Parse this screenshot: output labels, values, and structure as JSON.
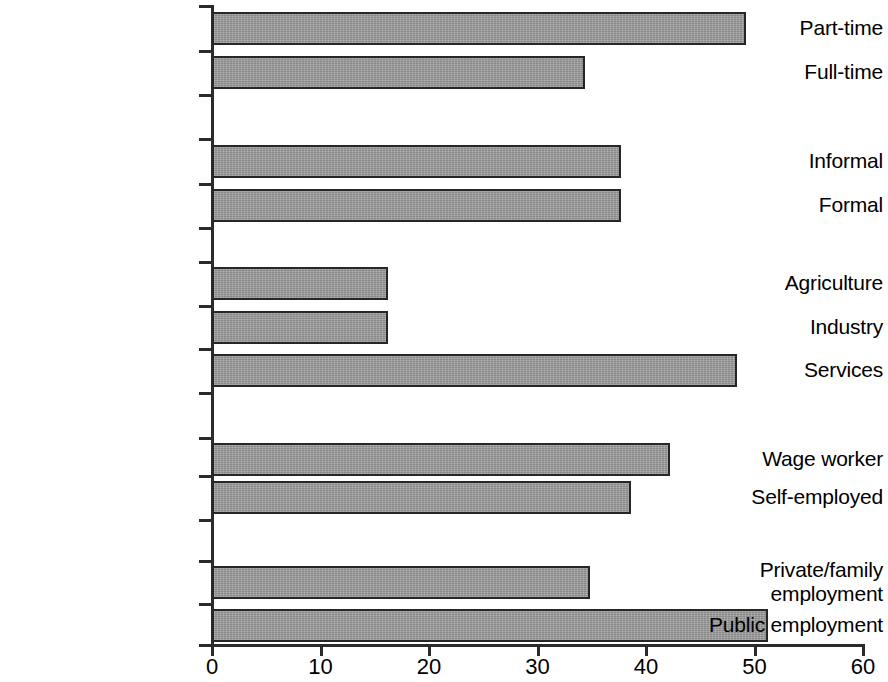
{
  "chart_data": {
    "type": "bar",
    "orientation": "horizontal",
    "title": "",
    "subtitle": "",
    "xlabel": "",
    "ylabel": "",
    "xlim": [
      0,
      60
    ],
    "xticks": [
      0,
      10,
      20,
      30,
      40,
      50,
      60
    ],
    "xtick_labels": [
      "0",
      "10",
      "20",
      "30",
      "40",
      "50",
      "60"
    ],
    "grid": false,
    "legend": null,
    "bar_color": "#9b9b9b",
    "bar_edge_color": "#262626",
    "axis_color": "#2b2b2b",
    "categories": [
      "Part-time",
      "Full-time",
      "Informal",
      "Formal",
      "Agriculture",
      "Industry",
      "Services",
      "Wage worker",
      "Self-employed",
      "Private/family\nemployment",
      "Public employment"
    ],
    "values": [
      49.2,
      34.4,
      37.7,
      37.7,
      16.2,
      16.2,
      48.4,
      42.2,
      38.6,
      34.8,
      51.2
    ],
    "groups": [
      {
        "name": "work-hours",
        "categories": [
          "Part-time",
          "Full-time"
        ]
      },
      {
        "name": "formality",
        "categories": [
          "Informal",
          "Formal"
        ]
      },
      {
        "name": "sector",
        "categories": [
          "Agriculture",
          "Industry",
          "Services"
        ]
      },
      {
        "name": "status",
        "categories": [
          "Wage worker",
          "Self-employed"
        ]
      },
      {
        "name": "employer",
        "categories": [
          "Private/family employment",
          "Public employment"
        ]
      }
    ]
  },
  "bars": [
    {
      "label": "Part-time",
      "value": 49.2,
      "top": 12,
      "height": 33,
      "label_top": 16,
      "label_lines": 1
    },
    {
      "label": "Full-time",
      "value": 34.4,
      "top": 56,
      "height": 33,
      "label_top": 60,
      "label_lines": 1
    },
    {
      "label": "Informal",
      "value": 37.7,
      "top": 145,
      "height": 33,
      "label_top": 149,
      "label_lines": 1
    },
    {
      "label": "Formal",
      "value": 37.7,
      "top": 189,
      "height": 33,
      "label_top": 193,
      "label_lines": 1
    },
    {
      "label": "Agriculture",
      "value": 16.2,
      "top": 267,
      "height": 33,
      "label_top": 271,
      "label_lines": 1
    },
    {
      "label": "Industry",
      "value": 16.2,
      "top": 311,
      "height": 33,
      "label_top": 315,
      "label_lines": 1
    },
    {
      "label": "Services",
      "value": 48.4,
      "top": 354,
      "height": 33,
      "label_top": 358,
      "label_lines": 1
    },
    {
      "label": "Wage worker",
      "value": 42.2,
      "top": 443,
      "height": 33,
      "label_top": 447,
      "label_lines": 1
    },
    {
      "label": "Self-employed",
      "value": 38.6,
      "top": 481,
      "height": 33,
      "label_top": 485,
      "label_lines": 1
    },
    {
      "label": "Private/family\nemployment",
      "value": 34.8,
      "top": 566,
      "height": 33,
      "label_top": 558,
      "label_lines": 2
    },
    {
      "label": "Public employment",
      "value": 51.2,
      "top": 609,
      "height": 33,
      "label_top": 613,
      "label_lines": 1
    }
  ],
  "x_ticks": [
    {
      "label": "0",
      "value": 0
    },
    {
      "label": "10",
      "value": 10
    },
    {
      "label": "20",
      "value": 20
    },
    {
      "label": "30",
      "value": 30
    },
    {
      "label": "40",
      "value": 40
    },
    {
      "label": "50",
      "value": 50
    },
    {
      "label": "60",
      "value": 60
    }
  ],
  "y_ticks": [
    5,
    50,
    94,
    138,
    183,
    227,
    261,
    305,
    348,
    392,
    437,
    475,
    519,
    560,
    603,
    644
  ],
  "geometry": {
    "origin_x": 212,
    "px_per_unit": 10.85
  }
}
